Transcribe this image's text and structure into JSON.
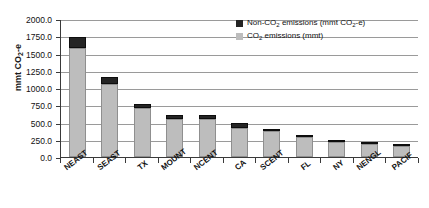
{
  "chart_data": {
    "type": "bar",
    "subtype": "stacked-vertical",
    "title": "",
    "xlabel": "",
    "ylabel": "mmt CO2-e",
    "ylim": [
      0,
      2000
    ],
    "ytick_step": 250,
    "grid": true,
    "legend_position": "top-right",
    "categories": [
      "NEAST",
      "SEAST",
      "TX",
      "MOUNT",
      "NCENT",
      "CA",
      "SCENT",
      "FL",
      "NY",
      "NENGL",
      "PACIF"
    ],
    "ytick_labels": [
      "0.0",
      "250.0",
      "500.0",
      "750.0",
      "1000.0",
      "1250.0",
      "1500.0",
      "1750.0",
      "2000.0"
    ],
    "series": [
      {
        "name": "CO2 emissions (mmt)",
        "color": "#bdbdbd",
        "values": [
          1580,
          1060,
          710,
          550,
          555,
          420,
          370,
          290,
          215,
          185,
          155
        ]
      },
      {
        "name": "Non-CO2 emissions (mmt CO2-e)",
        "color": "#242424",
        "values": [
          165,
          95,
          60,
          60,
          60,
          75,
          35,
          30,
          20,
          15,
          15
        ]
      }
    ],
    "totals": [
      1745,
      1155,
      770,
      610,
      615,
      495,
      405,
      320,
      235,
      200,
      170
    ]
  },
  "axis": {
    "y_title_main": "mmt CO",
    "y_title_sub": "2",
    "y_title_tail": "-e"
  },
  "legend": {
    "items": [
      {
        "key": "non-co2",
        "pre": "Non-CO",
        "sub": "2",
        "mid": " emissions (mmt CO",
        "sub2": "2",
        "post": "-e)"
      },
      {
        "key": "co2",
        "pre": "CO",
        "sub": "2",
        "mid": " emissions (mmt)",
        "sub2": "",
        "post": ""
      }
    ]
  }
}
